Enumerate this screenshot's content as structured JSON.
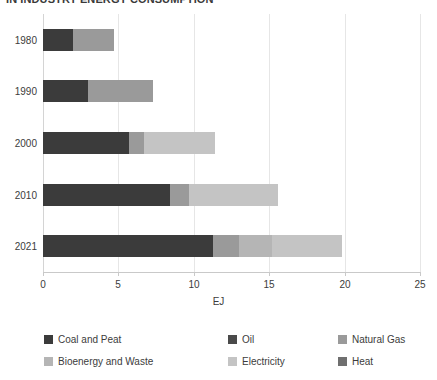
{
  "chart_data": {
    "type": "bar",
    "orientation": "horizontal",
    "stacked": true,
    "title": "IN INDUSTRY ENERGY CONSUMPTION",
    "xlabel": "EJ",
    "ylabel": "",
    "xlim": [
      0,
      25
    ],
    "xticks": [
      0,
      5,
      10,
      15,
      20,
      25
    ],
    "xtick_labels": [
      "0",
      "5",
      "10",
      "15",
      "20",
      "25"
    ],
    "categories": [
      "1980",
      "1990",
      "2000",
      "2010",
      "2021"
    ],
    "grid": true,
    "legend_position": "bottom",
    "series": [
      {
        "name": "Coal and Peat",
        "color": "#3b3b3b",
        "values": [
          2.0,
          3.0,
          5.7,
          8.4,
          11.3
        ]
      },
      {
        "name": "Oil",
        "color": "#4a4a4a",
        "values": [
          0,
          0,
          0,
          0,
          0
        ]
      },
      {
        "name": "Natural Gas",
        "color": "#9a9a9a",
        "values": [
          2.7,
          4.3,
          1.0,
          1.3,
          1.7
        ]
      },
      {
        "name": "Bioenergy and Waste",
        "color": "#b5b5b5",
        "values": [
          0,
          0,
          0,
          0,
          2.2
        ]
      },
      {
        "name": "Electricity",
        "color": "#c4c4c4",
        "values": [
          0,
          0,
          4.7,
          5.9,
          4.6
        ]
      },
      {
        "name": "Heat",
        "color": "#6f6f6f",
        "values": [
          0,
          0,
          0,
          0,
          0
        ]
      }
    ],
    "totals": [
      4.7,
      7.3,
      11.4,
      15.6,
      19.8
    ]
  },
  "legend": {
    "items": [
      {
        "label": "Coal and Peat",
        "color": "#3b3b3b"
      },
      {
        "label": "Oil",
        "color": "#4a4a4a"
      },
      {
        "label": "Natural Gas",
        "color": "#9a9a9a"
      },
      {
        "label": "Bioenergy and Waste",
        "color": "#b5b5b5"
      },
      {
        "label": "Electricity",
        "color": "#c4c4c4"
      },
      {
        "label": "Heat",
        "color": "#6f6f6f"
      }
    ]
  }
}
